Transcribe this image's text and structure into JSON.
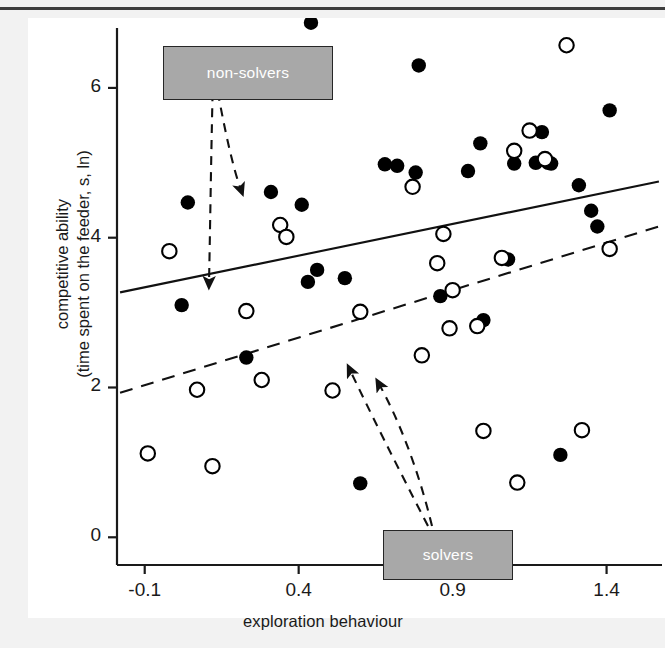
{
  "figure": {
    "annotations": [
      {
        "id": "non-solvers",
        "label": "non-solvers"
      },
      {
        "id": "solvers",
        "label": "solvers"
      }
    ]
  },
  "chart_data": {
    "type": "scatter",
    "title": "",
    "xlabel": "exploration behaviour",
    "ylabel": "competitive ability",
    "ylabel_line2": "(time spent on the feeder, s, ln)",
    "xlim": [
      -0.19,
      1.58
    ],
    "ylim": [
      -0.37,
      6.8
    ],
    "xticks": [
      -0.1,
      0.4,
      0.9,
      1.4
    ],
    "xticklabels": [
      "-0.1",
      "0.4",
      "0.9",
      "1.4"
    ],
    "yticks": [
      0,
      2,
      4,
      6
    ],
    "yticklabels": [
      "0",
      "2",
      "4",
      "6"
    ],
    "grid": false,
    "legend_position": "annotated-boxes",
    "series": [
      {
        "name": "non-solvers",
        "marker": "filled-circle",
        "color": "#000000",
        "points": [
          [
            0.04,
            4.47
          ],
          [
            0.02,
            3.1
          ],
          [
            0.23,
            2.4
          ],
          [
            0.31,
            4.61
          ],
          [
            0.41,
            4.44
          ],
          [
            0.43,
            3.41
          ],
          [
            0.46,
            3.57
          ],
          [
            0.44,
            6.87
          ],
          [
            0.55,
            3.46
          ],
          [
            0.6,
            0.72
          ],
          [
            0.68,
            4.98
          ],
          [
            0.72,
            4.96
          ],
          [
            0.78,
            4.87
          ],
          [
            0.79,
            6.3
          ],
          [
            0.86,
            3.22
          ],
          [
            0.95,
            4.89
          ],
          [
            0.99,
            5.26
          ],
          [
            1.0,
            2.9
          ],
          [
            1.08,
            3.71
          ],
          [
            1.1,
            4.99
          ],
          [
            1.17,
            5.0
          ],
          [
            1.19,
            5.41
          ],
          [
            1.21,
            5.0
          ],
          [
            1.22,
            4.99
          ],
          [
            1.25,
            1.1
          ],
          [
            1.31,
            4.7
          ],
          [
            1.35,
            4.36
          ],
          [
            1.37,
            4.15
          ],
          [
            1.41,
            5.7
          ]
        ]
      },
      {
        "name": "solvers",
        "marker": "open-circle",
        "color": "#000000",
        "points": [
          [
            -0.09,
            1.12
          ],
          [
            -0.02,
            3.82
          ],
          [
            0.07,
            1.97
          ],
          [
            0.12,
            0.95
          ],
          [
            0.23,
            3.02
          ],
          [
            0.28,
            2.1
          ],
          [
            0.34,
            4.17
          ],
          [
            0.36,
            4.01
          ],
          [
            0.51,
            1.96
          ],
          [
            0.6,
            3.01
          ],
          [
            0.77,
            4.68
          ],
          [
            0.8,
            2.43
          ],
          [
            0.85,
            3.66
          ],
          [
            0.87,
            4.05
          ],
          [
            0.89,
            2.79
          ],
          [
            0.9,
            3.3
          ],
          [
            0.98,
            2.82
          ],
          [
            1.0,
            1.42
          ],
          [
            1.06,
            3.73
          ],
          [
            1.1,
            5.16
          ],
          [
            1.11,
            0.73
          ],
          [
            1.15,
            5.43
          ],
          [
            1.2,
            5.05
          ],
          [
            1.27,
            6.57
          ],
          [
            1.32,
            1.43
          ],
          [
            1.41,
            3.85
          ]
        ]
      }
    ],
    "fit_lines": [
      {
        "name": "non-solvers-fit",
        "style": "solid",
        "x": [
          -0.18,
          1.57
        ],
        "y": [
          3.27,
          4.75
        ]
      },
      {
        "name": "solvers-fit",
        "style": "dashed",
        "x": [
          -0.18,
          1.57
        ],
        "y": [
          1.93,
          4.15
        ]
      }
    ],
    "annotations": [
      {
        "text": "non-solvers",
        "points_to": [
          [
            0.18,
            3.43
          ],
          [
            0.38,
            5.1
          ]
        ]
      },
      {
        "text": "solvers",
        "points_to": [
          [
            0.56,
            2.05
          ],
          [
            0.68,
            3.33
          ]
        ]
      }
    ]
  }
}
